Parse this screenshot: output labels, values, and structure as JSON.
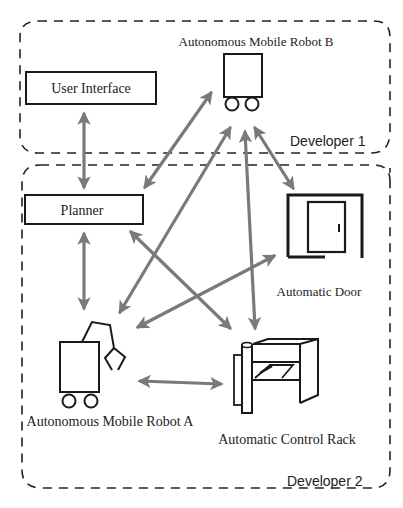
{
  "diagram": {
    "groups": [
      {
        "id": "dev1",
        "label": "Developer 1"
      },
      {
        "id": "dev2",
        "label": "Developer 2"
      }
    ],
    "nodes": {
      "user_interface": {
        "label": "User Interface",
        "group": "dev1",
        "shape": "box"
      },
      "robot_b": {
        "label": "Autonomous Mobile Robot B",
        "group": "dev1",
        "shape": "robot-icon"
      },
      "planner": {
        "label": "Planner",
        "group": "dev2",
        "shape": "box"
      },
      "door": {
        "label": "Automatic Door",
        "group": "dev2",
        "shape": "door-icon"
      },
      "robot_a": {
        "label": "Autonomous Mobile Robot A",
        "group": "dev2",
        "shape": "robot-arm-icon"
      },
      "rack": {
        "label": "Automatic Control Rack",
        "group": "dev2",
        "shape": "rack-icon"
      }
    },
    "edges": [
      {
        "from": "user_interface",
        "to": "planner",
        "type": "bidirectional"
      },
      {
        "from": "robot_b",
        "to": "planner",
        "type": "bidirectional"
      },
      {
        "from": "robot_b",
        "to": "robot_a",
        "type": "bidirectional"
      },
      {
        "from": "robot_b",
        "to": "rack",
        "type": "bidirectional"
      },
      {
        "from": "robot_b",
        "to": "door",
        "type": "bidirectional"
      },
      {
        "from": "planner",
        "to": "robot_a",
        "type": "bidirectional"
      },
      {
        "from": "planner",
        "to": "rack",
        "type": "bidirectional"
      },
      {
        "from": "robot_a",
        "to": "door",
        "type": "bidirectional"
      },
      {
        "from": "robot_a",
        "to": "rack",
        "type": "bidirectional"
      }
    ],
    "colors": {
      "line": "#1a1a1a",
      "arrow": "#7a7a7a",
      "dash": "#222222"
    }
  }
}
